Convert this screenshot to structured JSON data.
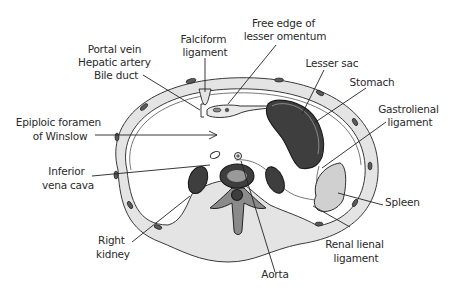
{
  "figure": {
    "labels": {
      "falciform_ligament": [
        "Falciform",
        "ligament"
      ],
      "free_edge_lesser_omentum": [
        "Free edge of",
        "lesser omentum"
      ],
      "portal_triad": [
        "Portal vein",
        "Hepatic artery",
        "Bile duct"
      ],
      "lesser_sac": [
        "Lesser sac"
      ],
      "stomach": [
        "Stomach"
      ],
      "gastrolienal_ligament": [
        "Gastrolienal",
        "ligament"
      ],
      "epiploic_foramen": [
        "Epiploic foramen",
        "of Winslow"
      ],
      "inferior_vena_cava": [
        "Inferior",
        "vena cava"
      ],
      "spleen": [
        "Spleen"
      ],
      "right_kidney": [
        "Right",
        "kidney"
      ],
      "renal_lienal_ligament": [
        "Renal lienal",
        "ligament"
      ],
      "aorta": [
        "Aorta"
      ]
    }
  },
  "colors": {
    "wall_fill": "#e4e4e4",
    "organ_dark": "#3e3e3e",
    "organ_light": "#d0d0d0",
    "line": "#222222",
    "text": "#2a2a2a"
  }
}
